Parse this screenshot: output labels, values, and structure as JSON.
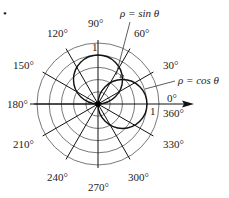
{
  "figure": {
    "marker": "•",
    "center": {
      "x": 98,
      "y": 104
    },
    "ring_step": 12.2,
    "ring_count": 5,
    "unit_radius": 49,
    "spoke_radius": 64,
    "angle_labels": [
      {
        "text": "90°",
        "x": 88,
        "y": 27
      },
      {
        "text": "60°",
        "x": 134,
        "y": 37
      },
      {
        "text": "30°",
        "x": 163,
        "y": 69
      },
      {
        "text": "0°",
        "x": 167,
        "y": 102
      },
      {
        "text": "360°",
        "x": 163,
        "y": 117
      },
      {
        "text": "120°",
        "x": 47,
        "y": 37
      },
      {
        "text": "150°",
        "x": 13,
        "y": 69
      },
      {
        "text": "180°",
        "x": 7,
        "y": 108
      },
      {
        "text": "210°",
        "x": 13,
        "y": 148
      },
      {
        "text": "240°",
        "x": 47,
        "y": 181
      },
      {
        "text": "270°",
        "x": 88,
        "y": 191
      },
      {
        "text": "300°",
        "x": 128,
        "y": 181
      },
      {
        "text": "330°",
        "x": 163,
        "y": 148
      }
    ],
    "unit_labels": [
      {
        "text": "1",
        "x": 92,
        "y": 51
      },
      {
        "text": "1",
        "x": 150,
        "y": 115
      }
    ],
    "curves": [
      {
        "name": "sin",
        "label": "ρ = sin θ",
        "label_x": 120,
        "label_y": 17
      },
      {
        "name": "cos",
        "label": "ρ = cos θ",
        "label_x": 178,
        "label_y": 84
      }
    ]
  },
  "chart_data": {
    "type": "line",
    "title": "",
    "coordinate_system": "polar",
    "angle_ticks_deg": [
      0,
      30,
      60,
      90,
      120,
      150,
      180,
      210,
      240,
      270,
      300,
      330,
      360
    ],
    "radial_rings": [
      0.25,
      0.5,
      0.75,
      1.0,
      1.25
    ],
    "radial_unit_label": "1",
    "series": [
      {
        "name": "ρ = sin θ",
        "equation": "rho = sin(theta)",
        "shape": "circle",
        "center_polar": [
          0.5,
          90
        ],
        "diameter": 1
      },
      {
        "name": "ρ = cos θ",
        "equation": "rho = cos(theta)",
        "shape": "circle",
        "center_polar": [
          0.5,
          0
        ],
        "diameter": 1
      }
    ],
    "polar_axis_arrow": "0°"
  }
}
